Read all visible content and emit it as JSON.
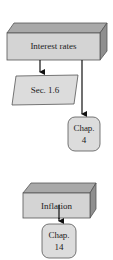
{
  "diagram": {
    "nodes": [
      {
        "id": "interest-rates",
        "label": "Interest rates",
        "shape": "3d-box"
      },
      {
        "id": "sec-1-6",
        "label": "Sec. 1.6",
        "shape": "parallelogram"
      },
      {
        "id": "chap-4",
        "label_line1": "Chap.",
        "label_line2": "4",
        "shape": "rounded-rect"
      },
      {
        "id": "inflation",
        "label": "Inflation",
        "shape": "3d-box"
      },
      {
        "id": "chap-14",
        "label_line1": "Chap.",
        "label_line2": "14",
        "shape": "rounded-rect"
      }
    ],
    "edges": [
      {
        "from": "interest-rates",
        "to": "sec-1-6"
      },
      {
        "from": "interest-rates",
        "to": "chap-4"
      },
      {
        "from": "inflation",
        "to": "chap-14"
      }
    ],
    "colors": {
      "box_front": "#d4d4d4",
      "box_top": "#a9a9a9",
      "box_side": "#8f8f8f",
      "node_fill": "#dcdcdc",
      "stroke": "#555555",
      "arrow": "#111111"
    }
  }
}
